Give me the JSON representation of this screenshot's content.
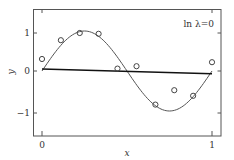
{
  "chart_data": {
    "type": "scatter",
    "title": "",
    "xlabel": "x",
    "ylabel": "y",
    "annotation": "ln λ=0",
    "xlim": [
      -0.05,
      1.05
    ],
    "ylim": [
      -1.5,
      1.5
    ],
    "x_ticks": [
      0,
      1
    ],
    "x_tick_labels": [
      "0",
      "1"
    ],
    "y_ticks": [
      1,
      0,
      -1
    ],
    "y_tick_labels": [
      "1",
      "0",
      "−1"
    ],
    "grid": false,
    "legend": null,
    "series": [
      {
        "name": "observations",
        "kind": "scatter",
        "marker": "open-circle",
        "x": [
          0.0,
          0.111,
          0.222,
          0.333,
          0.444,
          0.556,
          0.667,
          0.778,
          0.889,
          1.0
        ],
        "y": [
          0.3,
          0.77,
          0.95,
          0.93,
          0.06,
          0.12,
          -0.84,
          -0.48,
          -0.62,
          0.22
        ]
      },
      {
        "name": "true function sin(2πx)",
        "kind": "line",
        "color": "#555555",
        "function": "sin(2*pi*x)"
      },
      {
        "name": "fitted polynomial (ln λ=0)",
        "kind": "line",
        "color": "#111111",
        "x": [
          0.0,
          1.0
        ],
        "y": [
          0.05,
          -0.07
        ]
      }
    ]
  },
  "labels": {
    "annotation": "ln λ=0",
    "xlabel": "x",
    "ylabel": "y",
    "xtick0": "0",
    "xtick1": "1",
    "ytick1": "1",
    "ytick0": "0",
    "ytickm1": "−1"
  }
}
